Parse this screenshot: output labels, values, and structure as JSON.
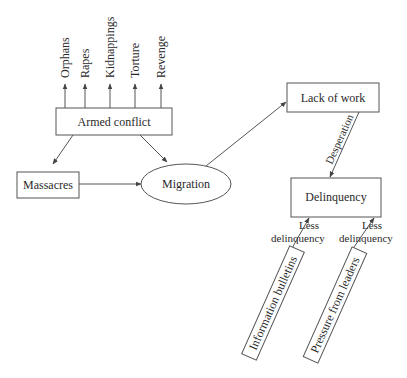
{
  "diagram": {
    "nodes": {
      "armed_conflict": "Armed conflict",
      "massacres": "Massacres",
      "migration": "Migration",
      "lack_of_work": "Lack of work",
      "delinquency": "Delinquency",
      "information_bulletins": "Information bulletins",
      "pressure_from_leaders": "Pressure from leaders"
    },
    "consequences": [
      "Orphans",
      "Rapes",
      "Kidnappings",
      "Torture",
      "Revenge"
    ],
    "edge_labels": {
      "desperation": "Desperation",
      "less_delinquency_1": [
        "Less",
        "delinquency"
      ],
      "less_delinquency_2": [
        "Less",
        "delinquency"
      ]
    },
    "edges": [
      {
        "from": "Armed conflict",
        "to": "Orphans"
      },
      {
        "from": "Armed conflict",
        "to": "Rapes"
      },
      {
        "from": "Armed conflict",
        "to": "Kidnappings"
      },
      {
        "from": "Armed conflict",
        "to": "Torture"
      },
      {
        "from": "Armed conflict",
        "to": "Revenge"
      },
      {
        "from": "Armed conflict",
        "to": "Massacres"
      },
      {
        "from": "Armed conflict",
        "to": "Migration"
      },
      {
        "from": "Massacres",
        "to": "Migration"
      },
      {
        "from": "Migration",
        "to": "Lack of work"
      },
      {
        "from": "Lack of work",
        "to": "Delinquency",
        "label": "Desperation"
      },
      {
        "from": "Information bulletins",
        "to": "Delinquency",
        "label": "Less delinquency"
      },
      {
        "from": "Pressure from leaders",
        "to": "Delinquency",
        "label": "Less delinquency"
      }
    ]
  }
}
